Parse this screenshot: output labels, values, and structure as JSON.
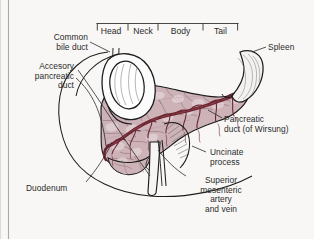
{
  "figure": {
    "title": "Pancreas",
    "border_color": "#9aa0a6",
    "background": "#f8f7f5",
    "ink": "#2b2b2b"
  },
  "segments": {
    "bracket_label": "pancreas-regions-bracket",
    "items": [
      {
        "label": "Head",
        "x": 104,
        "y": 27
      },
      {
        "label": "Neck",
        "x": 140,
        "y": 27
      },
      {
        "label": "Body",
        "x": 176,
        "y": 27
      },
      {
        "label": "Tail",
        "x": 219,
        "y": 27
      }
    ]
  },
  "labels": [
    {
      "name": "common-bile-duct",
      "text": "Common\nbile duct",
      "x": 44,
      "y": 33,
      "align": "right",
      "w": 52
    },
    {
      "name": "accessory-pancreatic-duct",
      "text": "Accesory\npancreatic\nduct",
      "x": 12,
      "y": 62,
      "align": "right",
      "w": 62
    },
    {
      "name": "spleen",
      "text": "Spleen",
      "x": 268,
      "y": 43,
      "align": "left",
      "w": 44
    },
    {
      "name": "pancreatic-duct-of-wirsung",
      "text": "Pancreatic\nduct (of Wirsung)",
      "x": 224,
      "y": 118,
      "align": "left",
      "w": 90
    },
    {
      "name": "uncinate-process",
      "text": "Uncinate\nprocess",
      "x": 208,
      "y": 150,
      "align": "left",
      "w": 60
    },
    {
      "name": "superior-mesenteric-vessels",
      "text": "Superior\nmesenteric\nartery\nand vein",
      "x": 186,
      "y": 178,
      "align": "center",
      "w": 72
    },
    {
      "name": "duodenum",
      "text": "Duodenum",
      "x": 26,
      "y": 186,
      "align": "left",
      "w": 58
    }
  ],
  "anatomy": {
    "pancreas_fill": "#cdb3b8",
    "pancreas_shadow": "#b79aa1",
    "pancreas_highlight": "#e4d3d6",
    "duct_color": "#6a2531",
    "duct_color_light": "#8a3b46",
    "organ_outline": "#1d1d1d",
    "duodenum_fill": "#fbfbfb",
    "spleen_fill": "#f2f1ef",
    "vessel_fill": "#f4f3f1",
    "leader_color": "#2b2b2b",
    "parts": [
      "pancreas-body",
      "pancreas-head",
      "pancreas-tail",
      "uncinate-process",
      "duodenum-loop",
      "duodenum-descending",
      "spleen",
      "pancreatic-duct",
      "accessory-duct",
      "superior-mesenteric-artery",
      "superior-mesenteric-vein"
    ]
  }
}
